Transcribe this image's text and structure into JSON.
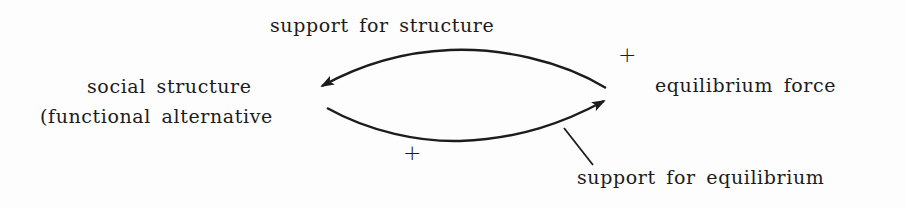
{
  "diagram": {
    "nodes": {
      "social_structure": {
        "line1": "social structure",
        "line2": "(functional alternative"
      },
      "equilibrium_force": {
        "label": "equilibrium force"
      }
    },
    "edges": {
      "top": {
        "from": "equilibrium force",
        "to": "social structure",
        "label": "support for structure",
        "sign": "+"
      },
      "bottom": {
        "from": "social structure",
        "to": "equilibrium force",
        "label": "support for equilibrium",
        "sign": "+"
      }
    },
    "colors": {
      "ink": "#1c1c1c",
      "background": "#fdfdfd"
    }
  }
}
